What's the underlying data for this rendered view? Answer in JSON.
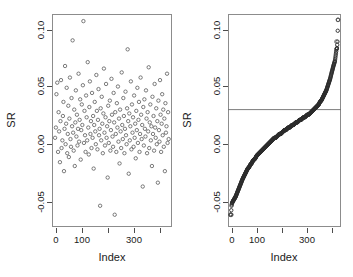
{
  "figure": {
    "width": 353,
    "height": 277,
    "background": "#ffffff",
    "panels": 2
  },
  "axis_labels": {
    "y_left": "SR",
    "y_right": "SR",
    "x_left": "Index",
    "x_right": "Index"
  },
  "ticks": {
    "y_labels": [
      "0.10",
      "0.05",
      "0.00",
      "-0.05"
    ],
    "y_values": [
      0.1,
      0.05,
      0.0,
      -0.05
    ],
    "x_labels": [
      "0",
      "100",
      "",
      "300",
      ""
    ],
    "x_values": [
      0,
      100,
      200,
      300,
      400
    ]
  },
  "colors": {
    "point_stroke": "#5a5a5a",
    "point_stroke_dark": "#2b2b2b",
    "axis": "#8c8c8c",
    "hline": "#6e6e6e",
    "text": "#1a1a1a"
  },
  "chart_data": [
    {
      "type": "scatter",
      "title": "",
      "xlabel": "Index",
      "ylabel": "SR",
      "xlim": [
        0,
        430
      ],
      "ylim": [
        -0.055,
        0.108
      ],
      "grid": false,
      "legend": null,
      "marker": "open-circle",
      "n_points": 420,
      "notes": "Unsorted Sharpe ratio values plotted against observation index; dense cloud centered near 0.01-0.02 with spread from -0.05 to 0.105",
      "x": [
        4,
        7,
        9,
        12,
        15,
        17,
        19,
        22,
        24,
        26,
        28,
        31,
        33,
        35,
        37,
        39,
        41,
        43,
        45,
        47,
        49,
        51,
        53,
        55,
        57,
        59,
        61,
        63,
        65,
        67,
        69,
        71,
        73,
        75,
        77,
        79,
        81,
        83,
        85,
        87,
        89,
        91,
        93,
        95,
        97,
        99,
        101,
        103,
        105,
        107,
        109,
        111,
        113,
        115,
        117,
        119,
        121,
        123,
        125,
        127,
        129,
        131,
        133,
        135,
        137,
        139,
        141,
        143,
        145,
        147,
        149,
        151,
        153,
        155,
        157,
        159,
        161,
        163,
        165,
        167,
        169,
        171,
        173,
        175,
        177,
        179,
        181,
        183,
        185,
        187,
        189,
        191,
        193,
        195,
        197,
        199,
        201,
        203,
        205,
        207,
        209,
        211,
        213,
        215,
        217,
        219,
        221,
        223,
        225,
        227,
        229,
        231,
        233,
        235,
        237,
        239,
        241,
        243,
        245,
        247,
        249,
        251,
        253,
        255,
        257,
        259,
        261,
        263,
        265,
        267,
        269,
        271,
        273,
        275,
        277,
        279,
        281,
        283,
        285,
        287,
        289,
        291,
        293,
        295,
        297,
        299,
        301,
        303,
        305,
        307,
        309,
        311,
        313,
        315,
        317,
        319,
        321,
        323,
        325,
        327,
        329,
        331,
        333,
        335,
        337,
        339,
        341,
        343,
        345,
        347,
        349,
        351,
        353,
        355,
        357,
        359,
        361,
        363,
        365,
        367,
        369,
        371,
        373,
        375,
        377,
        379,
        381,
        383,
        385,
        387,
        389,
        391,
        393,
        395,
        397,
        399,
        401,
        403,
        405,
        407,
        409,
        411,
        413,
        415,
        417,
        419,
        421,
        423,
        425
      ],
      "y": [
        0.013,
        0.021,
        0.047,
        0.056,
        0.002,
        0.033,
        0.018,
        -0.006,
        0.026,
        0.058,
        0.005,
        0.011,
        0.03,
        0.041,
        -0.013,
        0.02,
        0.069,
        0.008,
        0.024,
        0.052,
        0.001,
        0.016,
        0.038,
        -0.002,
        0.028,
        0.06,
        0.012,
        0.006,
        0.044,
        0.022,
        0.089,
        0.017,
        0.003,
        0.035,
        -0.009,
        0.025,
        0.05,
        0.014,
        0.031,
        0.007,
        0.02,
        0.063,
        0.01,
        0.027,
        0.043,
        -0.004,
        0.019,
        0.039,
        0.023,
        0.054,
        0.104,
        0.009,
        0.034,
        0.015,
        0.002,
        0.046,
        0.029,
        0.011,
        0.072,
        0.021,
        0.0,
        0.037,
        0.057,
        0.016,
        0.026,
        0.005,
        0.048,
        0.013,
        0.03,
        -0.011,
        0.023,
        0.041,
        0.018,
        0.008,
        0.062,
        0.034,
        0.004,
        0.027,
        0.051,
        0.015,
        0.02,
        -0.04,
        0.036,
        0.011,
        0.045,
        0.024,
        0.001,
        0.032,
        0.067,
        0.017,
        0.007,
        0.029,
        0.055,
        0.013,
        0.022,
        -0.018,
        0.038,
        0.009,
        0.026,
        0.042,
        0.003,
        0.019,
        0.059,
        0.031,
        0.014,
        0.006,
        0.048,
        0.025,
        -0.047,
        0.033,
        0.016,
        0.002,
        0.04,
        0.021,
        0.053,
        0.01,
        0.028,
        -0.007,
        0.035,
        0.018,
        0.005,
        0.064,
        0.023,
        0.012,
        0.044,
        0.03,
        0.001,
        0.02,
        0.049,
        0.015,
        0.008,
        0.036,
        0.082,
        0.026,
        -0.015,
        0.032,
        0.011,
        0.022,
        0.057,
        0.004,
        0.039,
        0.017,
        0.029,
        0.006,
        0.046,
        0.013,
        0.024,
        -0.003,
        0.034,
        0.019,
        0.052,
        0.009,
        0.027,
        0.041,
        0.002,
        0.016,
        0.06,
        0.031,
        0.012,
        0.023,
        -0.025,
        0.037,
        0.007,
        0.043,
        0.02,
        0.014,
        0.05,
        0.028,
        0.001,
        0.033,
        0.018,
        0.068,
        0.005,
        0.025,
        0.039,
        0.011,
        0.022,
        -0.009,
        0.045,
        0.016,
        0.03,
        0.003,
        0.055,
        0.021,
        0.013,
        0.036,
        0.008,
        0.026,
        -0.022,
        0.042,
        0.019,
        0.01,
        0.058,
        0.031,
        0.002,
        0.024,
        0.047,
        0.015,
        0.035,
        0.006,
        0.028,
        -0.013,
        0.04,
        0.017,
        0.022,
        0.063,
        0.009,
        0.033,
        0.012,
        0.051,
        0.02,
        0.004,
        0.038,
        0.026,
        0.08,
        0.014,
        0.029,
        -0.005,
        0.044,
        0.007,
        0.023,
        0.056,
        0.018,
        0.011,
        0.034,
        0.001,
        0.027,
        0.041,
        -0.02,
        0.016,
        0.049,
        0.031,
        0.008,
        0.021,
        0.037,
        0.013,
        0.003,
        0.059,
        0.025,
        0.018,
        0.046,
        0.01,
        0.03,
        -0.01,
        0.022,
        0.053,
        0.015,
        0.035,
        0.005,
        0.028,
        0.042,
        0.012,
        0.019,
        0.066,
        0.002,
        0.033,
        0.024,
        0.048,
        0.009,
        0.016,
        0.038,
        -0.016,
        0.027,
        0.006,
        0.044,
        0.02,
        0.013,
        0.057,
        0.031,
        0.001,
        0.023,
        0.036,
        0.011,
        0.05,
        0.017,
        0.029,
        -0.028,
        0.042,
        0.007,
        0.025,
        0.014,
        0.061,
        0.032,
        0.003,
        0.019,
        0.045,
        0.022,
        0.01,
        0.039,
        0.027,
        0.005,
        0.016,
        -0.012,
        0.052,
        0.03,
        0.012,
        0.024,
        0.035,
        0.002,
        0.047,
        0.018,
        0.008,
        0.041,
        0.026,
        0.02,
        -0.035,
        0.013,
        0.055,
        0.033,
        0.004,
        0.021,
        0.038,
        0.015,
        0.009,
        0.028,
        0.044,
        0.017,
        0.001,
        0.049,
        0.023,
        0.011,
        0.031,
        0.006,
        0.036,
        -0.019,
        0.025,
        0.014,
        0.058,
        0.019,
        0.003,
        0.042,
        0.027,
        0.012,
        0.022,
        0.046,
        0.008,
        0.034,
        0.016,
        0.029,
        0.002,
        0.051,
        0.02,
        0.01,
        0.039,
        0.024,
        0.005,
        0.032,
        0.013,
        -0.023,
        0.043,
        0.018,
        0.026,
        0.007,
        0.054,
        0.03,
        0.001,
        0.021,
        0.037,
        0.015,
        0.011,
        0.048,
        0.023,
        0.004,
        0.033,
        0.019,
        0.028,
        0.009,
        0.06,
        0.014,
        0.002,
        0.04,
        0.025,
        0.017,
        0.006,
        0.035,
        0.022,
        0.012,
        0.045,
        0.029,
        -0.017,
        0.008,
        0.051,
        0.02,
        0.003,
        0.031,
        0.016,
        0.026,
        0.038,
        0.01,
        0.079,
        0.023,
        0.013,
        0.043,
        0.005,
        0.027,
        0.019,
        0.034,
        0.001,
        0.047,
        0.015,
        0.024,
        0.009,
        0.03,
        0.018,
        0.056,
        0.007,
        0.036,
        0.021,
        0.012,
        0.041,
        0.025,
        0.003,
        0.017,
        0.032,
        0.05,
        0.011,
        0.022,
        0.006,
        0.028,
        0.037,
        0.014,
        0.02,
        0.044,
        0.002,
        0.026,
        0.031,
        0.01,
        -0.021,
        0.035,
        0.018,
        0.046,
        0.008,
        0.023,
        0.013,
        0.029,
        0.004,
        0.039,
        0.016,
        0.052,
        0.024,
        0.011,
        0.033,
        0.019,
        0.007,
        0.027,
        0.042,
        0.015
      ]
    },
    {
      "type": "line",
      "title": "",
      "xlabel": "Index",
      "ylabel": "SR",
      "xlim": [
        0,
        430
      ],
      "ylim": [
        -0.055,
        0.108
      ],
      "grid": false,
      "legend": null,
      "marker": "filled-circle-dense",
      "n_points": 420,
      "annotations": [
        {
          "type": "hline",
          "y": 0.035,
          "label": "threshold"
        }
      ],
      "notes": "Sorted (ascending) Sharpe ratio values; sigmoid-shaped ordered curve crossing the horizontal threshold line at y=0.035 near index 350; isolated high outliers near 0.105 and 0.088 at far right; low outliers near -0.047 at far left",
      "x": [
        2,
        4,
        6,
        8,
        10,
        13,
        16,
        19,
        22,
        26,
        30,
        34,
        38,
        42,
        46,
        50,
        55,
        60,
        65,
        70,
        75,
        80,
        85,
        90,
        95,
        100,
        105,
        110,
        115,
        120,
        125,
        130,
        135,
        140,
        145,
        150,
        155,
        160,
        165,
        170,
        175,
        180,
        185,
        190,
        195,
        200,
        205,
        210,
        215,
        220,
        225,
        230,
        235,
        240,
        245,
        250,
        255,
        260,
        265,
        270,
        275,
        280,
        285,
        290,
        295,
        300,
        305,
        310,
        315,
        320,
        325,
        330,
        335,
        340,
        345,
        350,
        355,
        360,
        365,
        370,
        375,
        380,
        385,
        390,
        395,
        400,
        404,
        408,
        411,
        414,
        416,
        418,
        420,
        422,
        424,
        426
      ],
      "y": [
        -0.047,
        -0.047,
        -0.04,
        -0.038,
        -0.037,
        -0.036,
        -0.035,
        -0.034,
        -0.033,
        -0.031,
        -0.029,
        -0.027,
        -0.025,
        -0.023,
        -0.021,
        -0.019,
        -0.017,
        -0.015,
        -0.013,
        -0.011,
        -0.01,
        -0.008,
        -0.007,
        -0.005,
        -0.004,
        -0.003,
        -0.001,
        0.0,
        0.001,
        0.002,
        0.003,
        0.004,
        0.005,
        0.006,
        0.007,
        0.008,
        0.009,
        0.01,
        0.011,
        0.012,
        0.013,
        0.013,
        0.014,
        0.015,
        0.016,
        0.016,
        0.017,
        0.018,
        0.019,
        0.019,
        0.02,
        0.021,
        0.021,
        0.022,
        0.023,
        0.023,
        0.024,
        0.025,
        0.025,
        0.026,
        0.027,
        0.027,
        0.028,
        0.029,
        0.029,
        0.03,
        0.031,
        0.031,
        0.032,
        0.033,
        0.034,
        0.035,
        0.036,
        0.037,
        0.038,
        0.039,
        0.041,
        0.042,
        0.044,
        0.046,
        0.048,
        0.05,
        0.053,
        0.056,
        0.059,
        0.063,
        0.066,
        0.069,
        0.071,
        0.073,
        0.076,
        0.079,
        0.082,
        0.083,
        0.088,
        0.105
      ]
    }
  ]
}
